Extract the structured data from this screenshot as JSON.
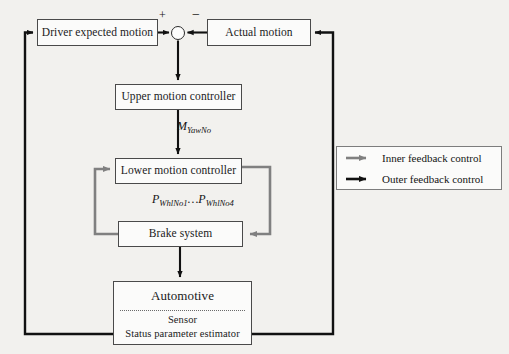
{
  "diagram": {
    "colors": {
      "background": "#f2f1ee",
      "box_fill": "#fbfbfa",
      "box_border": "#4a4a4a",
      "inner_loop": "#808080",
      "outer_loop": "#111111"
    },
    "nodes": {
      "driver_expected_motion": "Driver expected motion",
      "actual_motion": "Actual motion",
      "upper_motion_controller": "Upper motion controller",
      "lower_motion_controller": "Lower motion controller",
      "brake_system": "Brake system",
      "automotive_title": "Automotive",
      "automotive_sensor": "Sensor",
      "automotive_estimator": "Status parameter estimator"
    },
    "summing_junction": {
      "positive_sign": "+",
      "negative_sign": "−"
    },
    "signal_labels": {
      "yaw_moment_base": "M",
      "yaw_moment_sub": "YawNo",
      "wheel_pressure_base": "P",
      "wheel_pressure_sub_first": "WhlNo1",
      "wheel_pressure_ellipsis": "…",
      "wheel_pressure_base_second": "P",
      "wheel_pressure_sub_second": "WhlNo4"
    },
    "legend": {
      "items": [
        {
          "label": "Inner feedback control",
          "color": "#808080",
          "icon": "gray-arrow-icon"
        },
        {
          "label": "Outer feedback control",
          "color": "#111111",
          "icon": "black-arrow-icon"
        }
      ]
    }
  }
}
